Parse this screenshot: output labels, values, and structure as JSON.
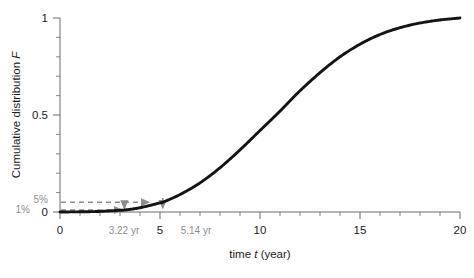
{
  "chart_data": {
    "type": "line",
    "title": "",
    "xlabel": "time t (year)",
    "ylabel": "Cumulative distribution F",
    "xlim": [
      0,
      20
    ],
    "ylim": [
      0,
      1
    ],
    "grid": false,
    "legend": null,
    "x_ticks": [
      "0",
      "5",
      "10",
      "15",
      "20"
    ],
    "x_tick_values": [
      0,
      5,
      10,
      15,
      20
    ],
    "x_minor_step": 1,
    "y_ticks": [
      "0",
      "0.5",
      "1"
    ],
    "y_tick_values": [
      0,
      0.5,
      1
    ],
    "y_minor_step": 0.1,
    "series": [
      {
        "name": "Cumulative distribution F(t)",
        "color": "#141414",
        "x": [
          0,
          1,
          2,
          3,
          3.22,
          4,
          5,
          5.14,
          6,
          7,
          8,
          9,
          10,
          11,
          12,
          13,
          14,
          15,
          16,
          17,
          18,
          19,
          20
        ],
        "values": [
          0.0,
          0.001,
          0.003,
          0.009,
          0.01,
          0.022,
          0.047,
          0.05,
          0.09,
          0.15,
          0.228,
          0.32,
          0.42,
          0.52,
          0.625,
          0.718,
          0.8,
          0.865,
          0.915,
          0.95,
          0.974,
          0.99,
          1.0
        ]
      }
    ],
    "annotations": [
      {
        "label": "5%",
        "kind": "y-level-label",
        "value": 0.05,
        "color": "#8d8d8d"
      },
      {
        "label": "1%",
        "kind": "y-level-label",
        "value": 0.01,
        "color": "#8d8d8d"
      },
      {
        "label": "3.22 yr",
        "kind": "x-value-label",
        "value": 3.22,
        "color": "#8d8d8d"
      },
      {
        "label": "5.14 yr",
        "kind": "x-value-label",
        "value": 5.14,
        "color": "#8d8d8d"
      }
    ],
    "guides": [
      {
        "name": "one-percent-guide",
        "from_f": 0.01,
        "to_t": 3.22,
        "color": "#8d8d8d",
        "style": "dashed-with-arrow"
      },
      {
        "name": "five-percent-guide",
        "from_f": 0.05,
        "to_t": 5.14,
        "color": "#8d8d8d",
        "style": "dashed-with-arrow"
      },
      {
        "name": "drop-to-axis-322",
        "at_t": 3.22,
        "color": "#8d8d8d",
        "style": "arrow-down"
      },
      {
        "name": "drop-to-axis-514",
        "at_t": 5.14,
        "color": "#8d8d8d",
        "style": "arrow-down"
      }
    ],
    "colors": {
      "curve": "#141414",
      "axis": "#6b6b6b",
      "annotation": "#8d8d8d",
      "text": "#1a1a1a",
      "background": "#ffffff"
    }
  }
}
